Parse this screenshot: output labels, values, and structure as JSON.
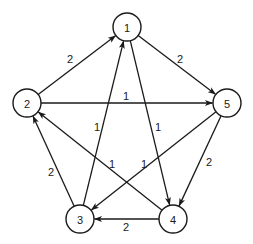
{
  "graph": {
    "type": "directed-weighted-graph",
    "node_radius": 14,
    "nodes": [
      {
        "id": "1",
        "label": "1",
        "x": 127,
        "y": 27
      },
      {
        "id": "2",
        "label": "2",
        "x": 27,
        "y": 103
      },
      {
        "id": "3",
        "label": "3",
        "x": 80,
        "y": 219
      },
      {
        "id": "4",
        "label": "4",
        "x": 173,
        "y": 219
      },
      {
        "id": "5",
        "label": "5",
        "x": 227,
        "y": 103
      }
    ],
    "edges": [
      {
        "from": "2",
        "to": "1",
        "weight": "2",
        "label_x": 70,
        "label_y": 59
      },
      {
        "from": "1",
        "to": "5",
        "weight": "2",
        "label_x": 180,
        "label_y": 59
      },
      {
        "from": "2",
        "to": "5",
        "weight": "1",
        "label_x": 126,
        "label_y": 96
      },
      {
        "from": "3",
        "to": "1",
        "weight": "1",
        "label_x": 97,
        "label_y": 127
      },
      {
        "from": "1",
        "to": "4",
        "weight": "1",
        "label_x": 158,
        "label_y": 127
      },
      {
        "from": "4",
        "to": "2",
        "weight": "1",
        "label_x": 112,
        "label_y": 164
      },
      {
        "from": "5",
        "to": "3",
        "weight": "1",
        "label_x": 144,
        "label_y": 164
      },
      {
        "from": "3",
        "to": "2",
        "weight": "2",
        "label_x": 51,
        "label_y": 172
      },
      {
        "from": "5",
        "to": "4",
        "weight": "2",
        "label_x": 209,
        "label_y": 162
      },
      {
        "from": "4",
        "to": "3",
        "weight": "2",
        "label_x": 126,
        "label_y": 227
      }
    ]
  }
}
